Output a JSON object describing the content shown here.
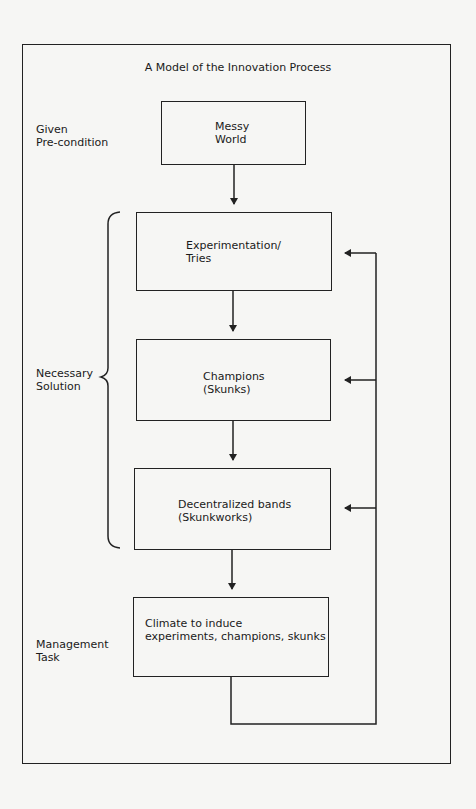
{
  "title": "A Model of the Innovation Process",
  "row_labels": {
    "given": [
      "Given",
      "Pre-condition"
    ],
    "necessary": [
      "Necessary",
      "Solution"
    ],
    "management": [
      "Management",
      "Task"
    ]
  },
  "boxes": [
    {
      "id": "messy-world",
      "lines": [
        "Messy",
        "World"
      ]
    },
    {
      "id": "experimentation",
      "lines": [
        "Experimentation/",
        "Tries"
      ]
    },
    {
      "id": "champions",
      "lines": [
        "Champions",
        "(Skunks)"
      ]
    },
    {
      "id": "decentralized-bands",
      "lines": [
        "Decentralized bands",
        "(Skunkworks)"
      ]
    },
    {
      "id": "climate",
      "lines": [
        "Climate to induce",
        "experiments, champions, skunks"
      ]
    }
  ],
  "colors": {
    "line": "#222222",
    "background": "#f6f6f4"
  }
}
